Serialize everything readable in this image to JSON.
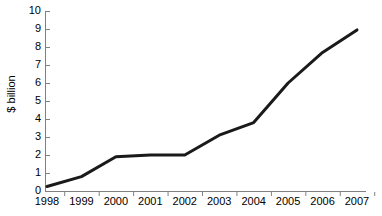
{
  "chart_data": {
    "type": "line",
    "title": "",
    "xlabel": "",
    "ylabel": "$ billion",
    "categories": [
      "1998",
      "1999",
      "2000",
      "2001",
      "2002",
      "2003",
      "2004",
      "2005",
      "2006",
      "2007"
    ],
    "values": [
      0.25,
      0.8,
      1.9,
      2.0,
      2.0,
      3.1,
      3.8,
      6.0,
      7.7,
      8.95
    ],
    "ylim": [
      0,
      10
    ],
    "yticks": [
      "0",
      "1",
      "2",
      "3",
      "4",
      "5",
      "6",
      "7",
      "8",
      "9",
      "10"
    ],
    "grid": false,
    "legend": false,
    "legend_position": "none",
    "series_color": "#1a1a1a",
    "axis_color": "#808080"
  },
  "axes": {
    "y_title": "$ billion"
  }
}
